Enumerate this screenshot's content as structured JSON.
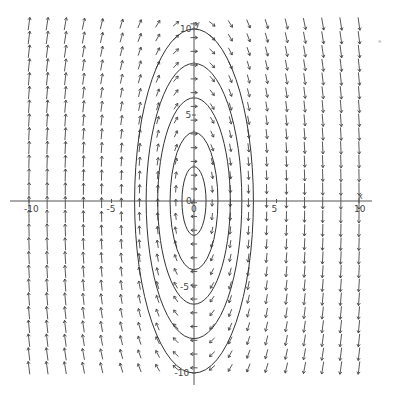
{
  "chart_data": {
    "type": "vector_field",
    "title": "",
    "xlabel": "x",
    "ylabel": "y",
    "xlim": [
      -10.5,
      10.5
    ],
    "ylim": [
      -10.5,
      10.5
    ],
    "grid": false,
    "x_ticks": [
      -10,
      -5,
      0,
      5,
      10
    ],
    "y_ticks": [
      -10,
      -5,
      0,
      5,
      10
    ],
    "x_tick_labels": [
      "-10",
      "-5",
      "0",
      "5",
      "10"
    ],
    "y_tick_labels": [
      "-10",
      "-5",
      "0",
      "5",
      "10"
    ],
    "field": {
      "description": "Clockwise rotational field F(x, y) = (y, -k*x): arrows point up for x<0, down for x>0, right above the x-axis near center, left below",
      "u": "y",
      "v": "-k*x",
      "k": 7.6,
      "x_samples": [
        -10,
        -8.9,
        -7.8,
        -6.7,
        -5.6,
        -4.4,
        -3.3,
        -2.2,
        -1.1,
        0,
        1.1,
        2.2,
        3.3,
        4.4,
        5.6,
        6.7,
        7.8,
        8.9,
        10
      ],
      "y_step": 0.8
    },
    "contours": {
      "description": "Closed elliptical level curves k*x^2 + y^2 = c centered at origin",
      "semi_axis_y": [
        2,
        4,
        6,
        8,
        10
      ],
      "semi_axis_x": [
        0.73,
        1.45,
        2.2,
        2.9,
        3.6
      ]
    },
    "origin_label": "0",
    "corner_marker": "*"
  },
  "axes": {
    "x_name": "x",
    "y_name": "y"
  }
}
